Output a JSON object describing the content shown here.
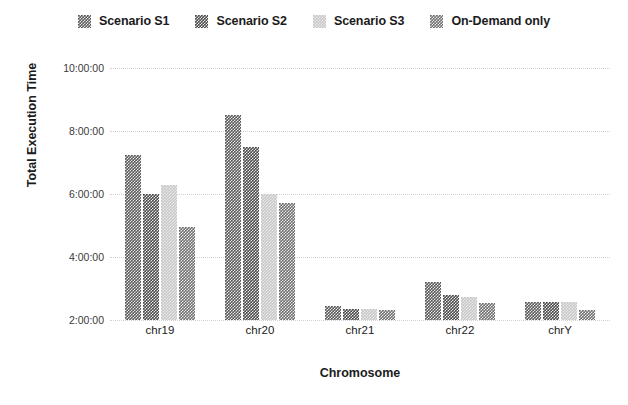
{
  "chart_data": {
    "type": "bar",
    "title": "",
    "xlabel": "Chromosome",
    "ylabel": "Total Execution Time",
    "categories": [
      "chr19",
      "chr20",
      "chr21",
      "chr22",
      "chrY"
    ],
    "ylim": [
      2,
      10
    ],
    "ytick_labels": [
      "10:00:00",
      "8:00:00",
      "6:00:00",
      "4:00:00",
      "2:00:00"
    ],
    "ytick_values": [
      10,
      8,
      6,
      4,
      2
    ],
    "grid": true,
    "legend_position": "top",
    "series": [
      {
        "name": "Scenario S1",
        "color": "#595959",
        "values": [
          7.25,
          8.5,
          2.45,
          3.2,
          2.58
        ],
        "value_labels": [
          "7:15:00",
          "8:30:00",
          "2:27:00",
          "3:12:00",
          "2:35:00"
        ]
      },
      {
        "name": "Scenario S2",
        "color": "#4a4a4a",
        "values": [
          6.0,
          7.5,
          2.35,
          2.78,
          2.57
        ],
        "value_labels": [
          "6:00:00",
          "7:30:00",
          "2:21:00",
          "2:47:00",
          "2:34:00"
        ]
      },
      {
        "name": "Scenario S3",
        "color": "#c9c9c9",
        "values": [
          6.3,
          6.0,
          2.35,
          2.72,
          2.58
        ],
        "value_labels": [
          "6:18:00",
          "6:00:00",
          "2:21:00",
          "2:43:00",
          "2:35:00"
        ]
      },
      {
        "name": "On-Demand only",
        "color": "#6e6e6e",
        "values": [
          4.95,
          5.7,
          2.33,
          2.55,
          2.33
        ],
        "value_labels": [
          "4:57:00",
          "5:42:00",
          "2:20:00",
          "2:33:00",
          "2:20:00"
        ]
      }
    ]
  },
  "legend": {
    "items": [
      {
        "label": "Scenario S1",
        "color": "#595959"
      },
      {
        "label": "Scenario S2",
        "color": "#4a4a4a"
      },
      {
        "label": "Scenario S3",
        "color": "#c9c9c9"
      },
      {
        "label": "On-Demand only",
        "color": "#6e6e6e"
      }
    ]
  },
  "axes": {
    "y_title": "Total Execution Time",
    "x_title": "Chromosome"
  }
}
